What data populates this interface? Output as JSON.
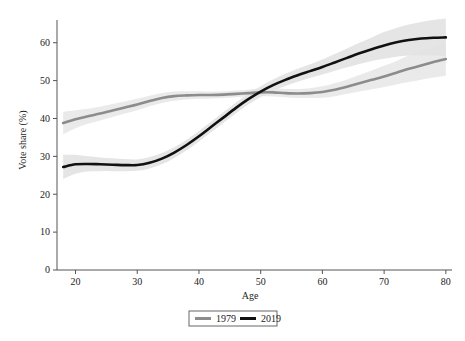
{
  "chart_data": {
    "type": "line",
    "title": "",
    "subtitle": "",
    "xlabel": "Age",
    "ylabel": "Vote share (%)",
    "xlim": [
      17,
      81
    ],
    "ylim": [
      0,
      66
    ],
    "xticks": [
      20,
      30,
      40,
      50,
      60,
      70,
      80
    ],
    "yticks": [
      0,
      10,
      20,
      30,
      40,
      50,
      60
    ],
    "grid": false,
    "legend_position": "bottom-center",
    "x": [
      18,
      20,
      22,
      24,
      26,
      28,
      30,
      32,
      34,
      36,
      38,
      40,
      42,
      44,
      46,
      48,
      50,
      52,
      54,
      56,
      58,
      60,
      62,
      64,
      66,
      68,
      70,
      72,
      74,
      76,
      78,
      80
    ],
    "series": [
      {
        "name": "1979",
        "color": "#8c8c8c",
        "band_color": "#e8e8e8",
        "values": [
          38.8,
          39.8,
          40.6,
          41.3,
          42.1,
          42.9,
          43.7,
          44.6,
          45.4,
          45.9,
          46.1,
          46.2,
          46.2,
          46.3,
          46.5,
          46.7,
          46.9,
          46.9,
          46.7,
          46.6,
          46.7,
          47.0,
          47.6,
          48.4,
          49.3,
          50.2,
          51.1,
          52.1,
          53.1,
          54.0,
          54.9,
          55.7
        ],
        "band_lower": [
          35.8,
          37.4,
          38.6,
          39.5,
          40.4,
          41.3,
          42.2,
          43.2,
          44.1,
          44.7,
          45.0,
          45.2,
          45.3,
          45.4,
          45.6,
          45.8,
          45.9,
          45.8,
          45.6,
          45.4,
          45.4,
          45.5,
          45.9,
          46.5,
          47.1,
          47.7,
          48.3,
          49.0,
          49.6,
          50.2,
          50.8,
          51.3
        ],
        "band_upper": [
          41.8,
          42.2,
          42.6,
          43.1,
          43.8,
          44.5,
          45.2,
          46.0,
          46.7,
          47.1,
          47.2,
          47.2,
          47.1,
          47.2,
          47.4,
          47.6,
          47.9,
          48.0,
          47.8,
          47.8,
          48.0,
          48.5,
          49.3,
          50.3,
          51.5,
          52.7,
          53.9,
          55.2,
          56.6,
          57.8,
          59.0,
          60.1
        ]
      },
      {
        "name": "2019",
        "color": "#111111",
        "band_color": "#e2e2e2",
        "values": [
          27.2,
          27.9,
          28.0,
          27.9,
          27.8,
          27.7,
          27.7,
          28.3,
          29.4,
          31.0,
          33.0,
          35.3,
          37.8,
          40.3,
          42.8,
          45.1,
          47.1,
          48.8,
          50.2,
          51.4,
          52.5,
          53.6,
          54.8,
          56.0,
          57.2,
          58.3,
          59.3,
          60.1,
          60.7,
          61.1,
          61.3,
          61.4
        ],
        "band_lower": [
          24.0,
          25.4,
          26.0,
          26.1,
          26.1,
          26.1,
          26.2,
          26.8,
          27.9,
          29.6,
          31.6,
          33.9,
          36.4,
          38.9,
          41.4,
          43.7,
          45.7,
          47.3,
          48.6,
          49.7,
          50.7,
          51.6,
          52.6,
          53.5,
          54.4,
          55.2,
          55.8,
          56.3,
          56.6,
          56.7,
          56.6,
          56.4
        ],
        "band_upper": [
          30.4,
          30.4,
          30.0,
          29.7,
          29.5,
          29.3,
          29.2,
          29.8,
          30.9,
          32.4,
          34.4,
          36.7,
          39.2,
          41.7,
          44.2,
          46.5,
          48.5,
          50.3,
          51.8,
          53.1,
          54.3,
          55.6,
          57.0,
          58.5,
          60.0,
          61.4,
          62.8,
          63.9,
          64.8,
          65.5,
          66.0,
          66.4
        ]
      }
    ]
  },
  "legend": {
    "entries": [
      {
        "label": "1979",
        "color": "#8c8c8c"
      },
      {
        "label": "2019",
        "color": "#111111"
      }
    ]
  },
  "axes": {
    "x_title": "Age",
    "y_title": "Vote share (%)",
    "x_tick_labels": [
      "20",
      "30",
      "40",
      "50",
      "60",
      "70",
      "80"
    ],
    "y_tick_labels": [
      "0",
      "10",
      "20",
      "30",
      "40",
      "50",
      "60"
    ]
  }
}
